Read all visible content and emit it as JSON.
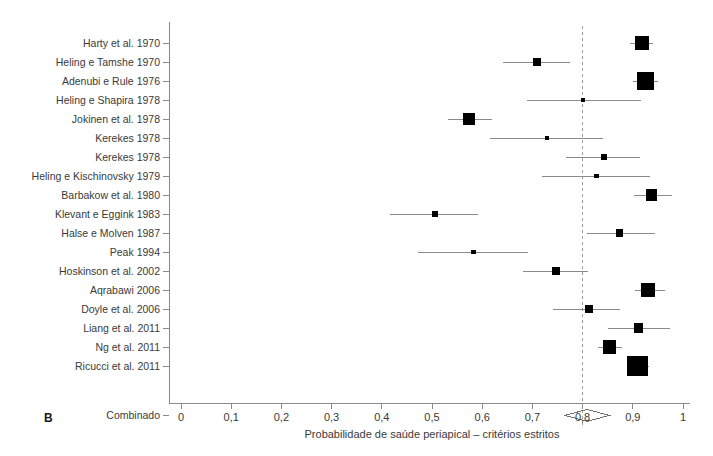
{
  "panel": {
    "label": "B"
  },
  "axis": {
    "title": "Probabilidade de saúde periapical – critérios estritos",
    "tick_labels": [
      "0",
      "0,1",
      "0,2",
      "0,3",
      "0,4",
      "0,5",
      "0,6",
      "0,7",
      "0,8",
      "0,9",
      "1"
    ],
    "tick_values": [
      0,
      0.1,
      0.2,
      0.3,
      0.4,
      0.5,
      0.6,
      0.7,
      0.8,
      0.9,
      1
    ]
  },
  "summary_row": {
    "label": "Combinado"
  },
  "colors": {
    "marker": "#000000",
    "line": "#8a8a8a",
    "axis": "#8a8a8a",
    "reference_line": "#9a9a9a",
    "text": "#3a3a3a",
    "background": "#ffffff"
  },
  "chart_data": {
    "type": "forest",
    "title": "",
    "xlabel": "Probabilidade de saúde periapical – critérios estritos",
    "ylabel": "",
    "xlim": [
      0,
      1
    ],
    "xticks": [
      0,
      0.1,
      0.2,
      0.3,
      0.4,
      0.5,
      0.6,
      0.7,
      0.8,
      0.9,
      1
    ],
    "grid": false,
    "legend": "none",
    "reference_line": 0.8,
    "studies": [
      {
        "label": "Harty et al. 1970",
        "estimate": 0.918,
        "ci_low": 0.895,
        "ci_high": 0.941,
        "weight": 0.52
      },
      {
        "label": "Heling e Tamshe 1970",
        "estimate": 0.709,
        "ci_low": 0.641,
        "ci_high": 0.775,
        "weight": 0.2
      },
      {
        "label": "Adenubi e Rule 1976",
        "estimate": 0.925,
        "ci_low": 0.9,
        "ci_high": 0.95,
        "weight": 0.7
      },
      {
        "label": "Heling e Shapira 1978",
        "estimate": 0.8,
        "ci_low": 0.689,
        "ci_high": 0.916,
        "weight": 0.08
      },
      {
        "label": "Jokinen et al. 1978",
        "estimate": 0.574,
        "ci_low": 0.532,
        "ci_high": 0.619,
        "weight": 0.4
      },
      {
        "label": "Kerekes 1978",
        "estimate": 0.729,
        "ci_low": 0.615,
        "ci_high": 0.84,
        "weight": 0.1
      },
      {
        "label": "Kerekes 1978",
        "estimate": 0.842,
        "ci_low": 0.767,
        "ci_high": 0.914,
        "weight": 0.14
      },
      {
        "label": "Heling e Kischinovsky 1979",
        "estimate": 0.828,
        "ci_low": 0.719,
        "ci_high": 0.934,
        "weight": 0.09
      },
      {
        "label": "Barbakow et al. 1980",
        "estimate": 0.938,
        "ci_low": 0.903,
        "ci_high": 0.978,
        "weight": 0.34
      },
      {
        "label": "Klevant e Eggink 1983",
        "estimate": 0.506,
        "ci_low": 0.416,
        "ci_high": 0.592,
        "weight": 0.13
      },
      {
        "label": "Halse e Molven 1987",
        "estimate": 0.874,
        "ci_low": 0.809,
        "ci_high": 0.944,
        "weight": 0.17
      },
      {
        "label": "Peak 1994",
        "estimate": 0.582,
        "ci_low": 0.472,
        "ci_high": 0.691,
        "weight": 0.1
      },
      {
        "label": "Hoskinson et al. 2002",
        "estimate": 0.747,
        "ci_low": 0.681,
        "ci_high": 0.811,
        "weight": 0.21
      },
      {
        "label": "Aqrabawi 2006",
        "estimate": 0.93,
        "ci_low": 0.904,
        "ci_high": 0.965,
        "weight": 0.48
      },
      {
        "label": "Doyle et al. 2006",
        "estimate": 0.813,
        "ci_low": 0.741,
        "ci_high": 0.875,
        "weight": 0.19
      },
      {
        "label": "Liang et al. 2011",
        "estimate": 0.911,
        "ci_low": 0.851,
        "ci_high": 0.974,
        "weight": 0.25
      },
      {
        "label": "Ng et al. 2011",
        "estimate": 0.853,
        "ci_low": 0.831,
        "ci_high": 0.878,
        "weight": 0.46
      },
      {
        "label": "Ricucci et al.  2011",
        "estimate": 0.91,
        "ci_low": 0.888,
        "ci_high": 0.932,
        "weight": 1.0
      }
    ],
    "summary": {
      "label": "Combinado",
      "estimate": 0.809,
      "ci_low": 0.765,
      "ci_high": 0.853
    }
  }
}
